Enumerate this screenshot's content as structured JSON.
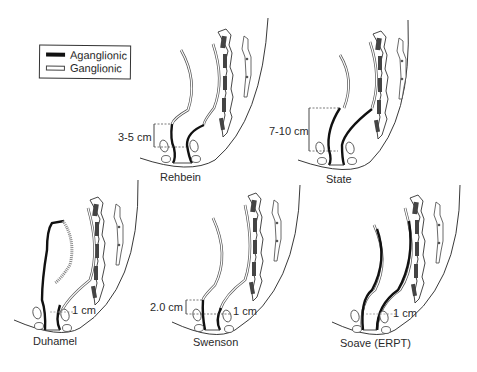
{
  "legend": {
    "items": [
      {
        "label": "Aganglionic",
        "style": "thick-black"
      },
      {
        "label": "Ganglionic",
        "style": "outlined-white"
      }
    ]
  },
  "panels": [
    {
      "name": "Rehbein",
      "measurements": [
        "3-5 cm"
      ]
    },
    {
      "name": "State",
      "measurements": [
        "7-10 cm"
      ]
    },
    {
      "name": "Duhamel",
      "measurements": [
        "1 cm"
      ]
    },
    {
      "name": "Swenson",
      "measurements": [
        "2.0 cm",
        "1 cm"
      ]
    },
    {
      "name": "Soave (ERPT)",
      "measurements": [
        "1 cm"
      ]
    }
  ],
  "colors": {
    "aganglionic": "#111111",
    "ganglionic_outline": "#555555",
    "background": "#ffffff"
  }
}
